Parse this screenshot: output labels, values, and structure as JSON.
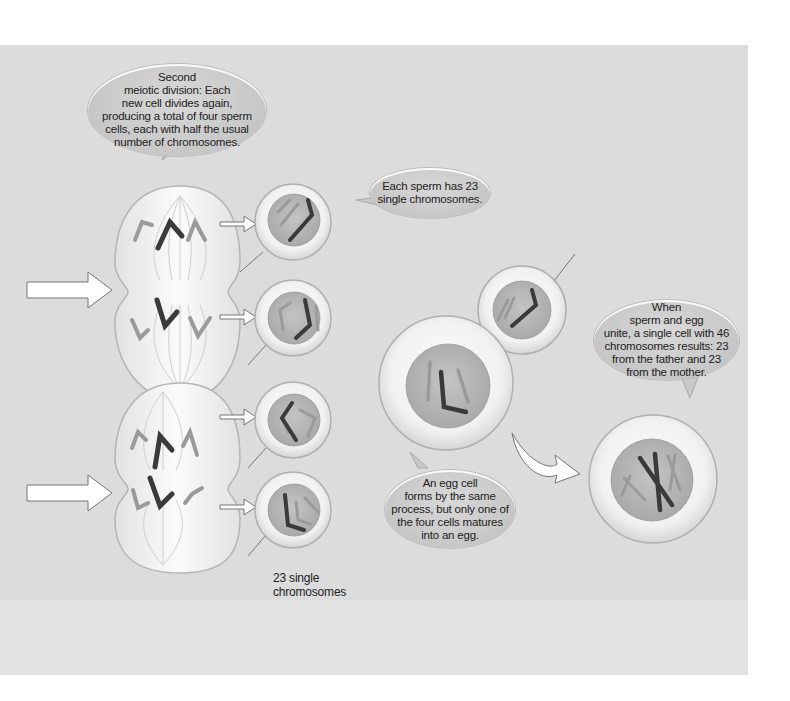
{
  "diagram": {
    "topic": "Meiosis and fertilization",
    "colors": {
      "panel_background": "#dcdcdc",
      "bubble_fill": "#c9c9c9",
      "cell_outer": "#f2f2f2",
      "nucleus": "#b5b5b5",
      "chromosome_dark": "#3a3a3a",
      "chromosome_light": "#9a9a9a",
      "arrow_fill": "#ffffff"
    },
    "callouts": {
      "second_division": "Second\nmeiotic division: Each\nnew cell divides again,\nproducing a total of four sperm\ncells, each with half the usual\nnumber of chromosomes.",
      "sperm_23": "Each sperm has 23\nsingle chromosomes.",
      "fertilization": "When\nsperm and egg\nunite, a single cell with 46\nchromosomes results: 23\nfrom the father and 23\nfrom the mother.",
      "egg_cell": "An egg cell\nforms by the same\nprocess, but only one of\nthe four cells matures\ninto an egg."
    },
    "labels": {
      "single_chromosomes": "23 single\nchromosomes"
    },
    "elements": {
      "dividing_cells": 2,
      "sperm_cells": 4,
      "egg_cells": 1,
      "zygote_cells": 1,
      "input_arrows": 2,
      "small_arrows": 4,
      "curved_arrow": 1
    }
  }
}
